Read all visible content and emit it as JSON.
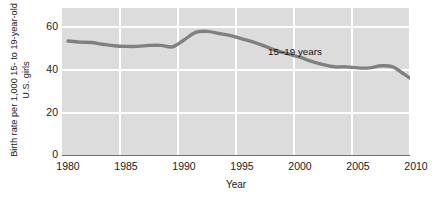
{
  "chart_data": {
    "type": "line",
    "title": "",
    "xlabel": "Year",
    "ylabel": "Birth rate per 1,000 15- to 19-year-old U.S. girls",
    "ylabel_line1": "Birth rate per 1,000 15- to 19-year-old",
    "ylabel_line2": "U.S. girls",
    "xlim": [
      1980,
      2013
    ],
    "ylim": [
      0,
      68
    ],
    "grid": true,
    "legend_position": "inline-annotation",
    "series": [
      {
        "name": "15–19 years",
        "color": "#808080",
        "x": [
          1980,
          1981,
          1982,
          1983,
          1984,
          1985,
          1986,
          1987,
          1988,
          1989,
          1990,
          1991,
          1992,
          1993,
          1994,
          1995,
          1996,
          1997,
          1998,
          1999,
          2000,
          2001,
          2002,
          2003,
          2004,
          2005,
          2006,
          2007,
          2008,
          2009,
          2010,
          2011,
          2012
        ],
        "values": [
          53.0,
          52.5,
          52.3,
          51.5,
          50.8,
          50.5,
          50.5,
          51.0,
          51.0,
          50.3,
          53.5,
          57.0,
          57.5,
          56.5,
          55.5,
          54.0,
          52.5,
          50.5,
          48.5,
          47.0,
          45.5,
          43.5,
          42.0,
          41.0,
          41.0,
          40.5,
          40.5,
          41.5,
          41.0,
          37.5,
          34.0,
          31.0,
          27.5
        ]
      }
    ],
    "y_ticks": [
      0,
      20,
      40,
      60
    ],
    "x_ticks": [
      1980,
      1985,
      1990,
      1995,
      2000,
      2005,
      2010
    ],
    "annotations": [
      {
        "text": "15–19 years",
        "x": 2000,
        "y": 49
      }
    ],
    "colors": {
      "plot_background": "#dcdcdc",
      "gridline": "#ffffff",
      "series_line": "#808080",
      "axis_line": "#6e6e6e",
      "text": "#1a1a1a",
      "page_background": "#ffffff"
    }
  }
}
